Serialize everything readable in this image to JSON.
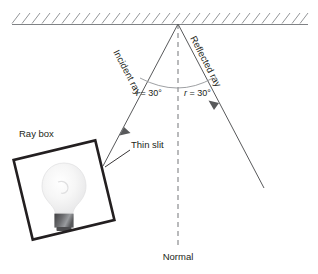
{
  "diagram": {
    "labels": {
      "incident_ray": "Incident ray",
      "reflected_ray": "Reflected ray",
      "normal": "Normal",
      "ray_box": "Ray box",
      "thin_slit": "Thin slit",
      "angle_incidence_symbol": "i",
      "angle_incidence_value": " = 30°",
      "angle_reflection_symbol": "r",
      "angle_reflection_value": " = 30°"
    },
    "colors": {
      "ray": "#58595b",
      "mirror": "#808285",
      "hatch": "#939598",
      "box": "#231f20",
      "text": "#231f20",
      "bulb_glass": "#f2f2f2",
      "bulb_base_dark": "#4d4d4f",
      "bulb_base_light": "#a7a9ac",
      "background": "#ffffff"
    },
    "geometry": {
      "mirror_y": 24,
      "mirror_x_start": 12,
      "mirror_x_end": 308,
      "incidence_point_x": 178,
      "incidence_point_y": 24,
      "normal_bottom_y": 245,
      "angle_of_incidence_deg": 30,
      "angle_of_reflection_deg": 30
    }
  }
}
